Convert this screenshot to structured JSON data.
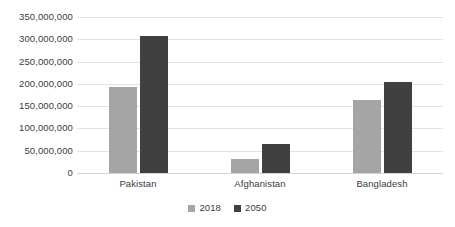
{
  "chart_data": {
    "type": "bar",
    "title": "",
    "subtitle": "",
    "xlabel": "",
    "ylabel": "",
    "categories": [
      "Pakistan",
      "Afghanistan",
      "Bangladesh"
    ],
    "series": [
      {
        "name": "2018",
        "color": "#a5a5a5",
        "values": [
          192000000,
          32000000,
          163000000
        ]
      },
      {
        "name": "2050",
        "color": "#404040",
        "values": [
          308000000,
          65000000,
          205000000
        ]
      }
    ],
    "ylim": [
      0,
      350000000
    ],
    "y_tick_values": [
      0,
      50000000,
      100000000,
      150000000,
      200000000,
      250000000,
      300000000,
      350000000
    ],
    "y_tick_labels": [
      "0",
      "50,000,000",
      "100,000,000",
      "150,000,000",
      "200,000,000",
      "250,000,000",
      "300,000,000",
      "350,000,000"
    ],
    "grid": true,
    "grid_color": "#e3e3e3",
    "legend": [
      "2018",
      "2050"
    ],
    "legend_position": "bottom-center",
    "background": "#ffffff",
    "text_color": "#3b3b3b"
  }
}
